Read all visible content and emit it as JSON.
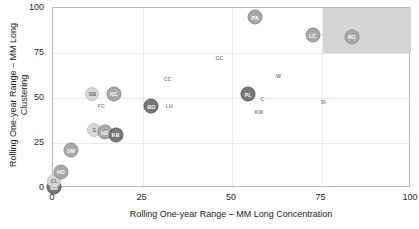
{
  "chart_data": {
    "type": "scatter",
    "title": "",
    "xlabel": "Rolling One-year Range – MM Long Concentration",
    "ylabel": "Rolling One-year Range – MM Long\nClustering",
    "ylabel_line1": "Rolling One-year Range – MM Long",
    "ylabel_line2": "Clustering",
    "xlim": [
      0,
      100
    ],
    "ylim": [
      0,
      100
    ],
    "xticks": [
      0,
      25,
      50,
      75,
      100
    ],
    "yticks": [
      0,
      25,
      50,
      75,
      100
    ],
    "xtick_labels": [
      "0",
      "25",
      "50",
      "75",
      "100"
    ],
    "ytick_labels": [
      "0",
      "25",
      "50",
      "75",
      "100"
    ],
    "grid": true,
    "legend": "none",
    "shaded_region": {
      "x0": 75,
      "x1": 100,
      "y0": 75,
      "y1": 100,
      "color": "#d4d4d4"
    },
    "points": [
      {
        "label": "BB",
        "x": 0.3,
        "y": 0.5,
        "shade": "dark"
      },
      {
        "label": "CL",
        "x": 0.4,
        "y": 4.0,
        "shade": "light"
      },
      {
        "label": "HO",
        "x": 2.2,
        "y": 9.0,
        "shade": "mid"
      },
      {
        "label": "SM",
        "x": 5.0,
        "y": 21.0,
        "shade": "mid"
      },
      {
        "label": "S",
        "x": 11.5,
        "y": 32.0,
        "shade": "light"
      },
      {
        "label": "HG",
        "x": 14.5,
        "y": 31.0,
        "shade": "mid"
      },
      {
        "label": "KB",
        "x": 17.5,
        "y": 29.5,
        "shade": "dark"
      },
      {
        "label": "SB",
        "x": 11.0,
        "y": 52.0,
        "shade": "light"
      },
      {
        "label": "KC",
        "x": 17.0,
        "y": 52.5,
        "shade": "mid"
      },
      {
        "label": "FC",
        "x": 13.5,
        "y": 45.5,
        "shade": "none"
      },
      {
        "label": "BO",
        "x": 27.5,
        "y": 45.5,
        "shade": "dark"
      },
      {
        "label": "LH",
        "x": 32.5,
        "y": 45.5,
        "shade": "none"
      },
      {
        "label": "CC",
        "x": 32.0,
        "y": 60.5,
        "shade": "none"
      },
      {
        "label": "GC",
        "x": 46.5,
        "y": 72.0,
        "shade": "none"
      },
      {
        "label": "PA",
        "x": 56.5,
        "y": 95.0,
        "shade": "mid"
      },
      {
        "label": "PL",
        "x": 54.5,
        "y": 52.0,
        "shade": "dark"
      },
      {
        "label": "C",
        "x": 58.5,
        "y": 49.5,
        "shade": "none"
      },
      {
        "label": "KW",
        "x": 57.5,
        "y": 42.0,
        "shade": "none"
      },
      {
        "label": "W",
        "x": 63.0,
        "y": 62.0,
        "shade": "none"
      },
      {
        "label": "LC",
        "x": 72.5,
        "y": 85.0,
        "shade": "mid"
      },
      {
        "label": "SI",
        "x": 75.5,
        "y": 48.0,
        "shade": "none"
      },
      {
        "label": "NG",
        "x": 83.5,
        "y": 84.0,
        "shade": "mid"
      }
    ]
  }
}
